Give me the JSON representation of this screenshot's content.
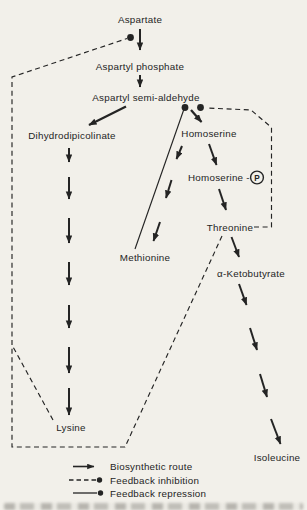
{
  "diagram_type": "metabolic-pathway",
  "colors": {
    "ink": "#242424",
    "paper": "#f2f0ea"
  },
  "nodes": {
    "aspartate": {
      "label": "Aspartate"
    },
    "aspartyl_phosphate": {
      "label": "Aspartyl phosphate"
    },
    "aspartyl_semi_aldehyde": {
      "label": "Aspartyl semi-aldehyde"
    },
    "dihydrodipicolinate": {
      "label": "Dihydrodipicolinate"
    },
    "homoserine": {
      "label": "Homoserine"
    },
    "homoserine_phosphate": {
      "label": "Homoserine -",
      "symbol": "P"
    },
    "threonine": {
      "label": "Threonine"
    },
    "methionine": {
      "label": "Methionine"
    },
    "alpha_ketobutyrate": {
      "label": "α-Ketobutyrate"
    },
    "lysine": {
      "label": "Lysine"
    },
    "isoleucine": {
      "label": "Isoleucine"
    }
  },
  "pathway": {
    "routes": [
      {
        "from": "Aspartate",
        "to": "Aspartyl phosphate",
        "arrows": 1
      },
      {
        "from": "Aspartyl phosphate",
        "to": "Aspartyl semi-aldehyde",
        "arrows": 1
      },
      {
        "from": "Aspartyl semi-aldehyde",
        "to": "Dihydrodipicolinate",
        "arrows": 1
      },
      {
        "from": "Dihydrodipicolinate",
        "to": "Lysine",
        "arrows": 7
      },
      {
        "from": "Aspartyl semi-aldehyde",
        "to": "Homoserine",
        "arrows": 1
      },
      {
        "from": "Homoserine",
        "to": "Methionine",
        "arrows": 3
      },
      {
        "from": "Homoserine",
        "to": "Homoserine-P",
        "arrows": 1
      },
      {
        "from": "Homoserine-P",
        "to": "Threonine",
        "arrows": 1
      },
      {
        "from": "Threonine",
        "to": "α-Ketobutyrate",
        "arrows": 1
      },
      {
        "from": "α-Ketobutyrate",
        "to": "Isoleucine",
        "arrows": 4
      }
    ],
    "feedback_inhibition": [
      {
        "from": "Lysine",
        "to": "Aspartate→Aspartyl phosphate step"
      },
      {
        "from": "Threonine",
        "to": "Aspartate→Aspartyl phosphate step"
      },
      {
        "from": "Threonine",
        "to": "Aspartyl semi-aldehyde→Homoserine step"
      }
    ],
    "feedback_repression": [
      {
        "from": "Methionine",
        "to": "Aspartyl semi-aldehyde→Homoserine step"
      }
    ]
  },
  "legend": {
    "items": [
      {
        "style": "solid-arrow",
        "label": "Biosynthetic route"
      },
      {
        "style": "dashed-dot",
        "label": "Feedback inhibition"
      },
      {
        "style": "solid-dot",
        "label": "Feedback repression"
      }
    ]
  }
}
